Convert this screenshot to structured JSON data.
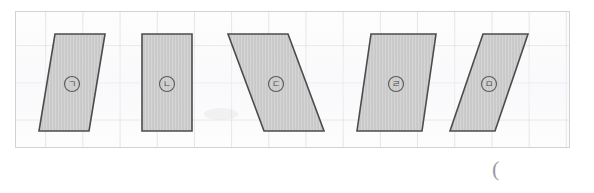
{
  "document": {
    "kind": "math-worksheet-figure",
    "panel": {
      "grid_spacing_px": 37,
      "border_color": "#d2d2d2",
      "background_color": "#fdfdfd",
      "grid_color": "#aaaab4"
    },
    "stray_mark": "("
  },
  "figures": {
    "fill_color": "#c9c9c9",
    "stroke_color": "#4c4c4c",
    "items": [
      {
        "id": "shape-1",
        "label": "㈠",
        "label_letter": "ㄱ",
        "type": "parallelogram",
        "lean": "right-top",
        "points": "39,22 89,22 73,119 23,119",
        "label_x": 56,
        "label_y": 72
      },
      {
        "id": "shape-2",
        "label": "㈡",
        "label_letter": "ㄴ",
        "type": "rectangle",
        "lean": "none",
        "points": "126,22 176,22 176,119 126,119",
        "label_x": 151,
        "label_y": 72
      },
      {
        "id": "shape-3",
        "label": "㈢",
        "label_letter": "ㄷ",
        "type": "parallelogram",
        "lean": "right-bottom",
        "points": "212,22 272,22 308,119 248,119",
        "label_x": 260,
        "label_y": 72
      },
      {
        "id": "shape-4",
        "label": "㈣",
        "label_letter": "ㄹ",
        "type": "parallelogram",
        "lean": "right-top",
        "points": "355,22 420,22 406,119 341,119",
        "label_x": 380,
        "label_y": 72
      },
      {
        "id": "shape-5",
        "label": "㈤",
        "label_letter": "ㅁ",
        "type": "parallelogram",
        "lean": "right-top",
        "points": "467,22 512,22 479,119 434,119",
        "label_x": 473,
        "label_y": 72
      }
    ]
  }
}
